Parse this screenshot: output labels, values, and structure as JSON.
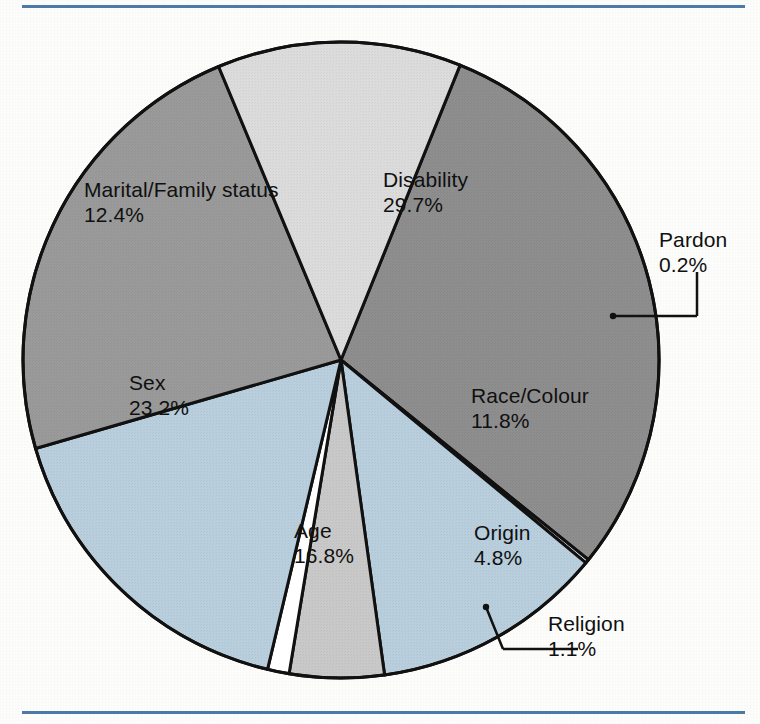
{
  "figure": {
    "frame_color": "#4b79a8",
    "background": "#fdfdfc"
  },
  "chart_data": {
    "type": "pie",
    "title": "",
    "subtitle": "",
    "xlabel": "",
    "ylabel": "",
    "units": "percent",
    "legend_position": "none",
    "labels_inline": true,
    "total": 100.0,
    "start_angle_deg": -68,
    "direction": "clockwise",
    "categories": [
      "Disability",
      "Pardon",
      "Race/Colour",
      "Origin",
      "Religion",
      "Age",
      "Sex",
      "Marital/Family status"
    ],
    "values": [
      29.7,
      0.2,
      11.8,
      4.8,
      1.1,
      16.8,
      23.2,
      12.4
    ],
    "slices": [
      {
        "name": "Disability",
        "label": "Disability",
        "value": 29.7,
        "value_text": "29.7%",
        "color": "#8e8e8e",
        "label_placement": "inside",
        "label_x": 383,
        "label_y": 168
      },
      {
        "name": "Pardon",
        "label": "Pardon",
        "value": 0.2,
        "value_text": "0.2%",
        "color": "#ffffff",
        "label_placement": "callout",
        "label_x": 659,
        "label_y": 228
      },
      {
        "name": "Race/Colour",
        "label": "Race/Colour",
        "value": 11.8,
        "value_text": "11.8%",
        "color": "#b9cfdd",
        "label_placement": "inside",
        "label_x": 471,
        "label_y": 384
      },
      {
        "name": "Origin",
        "label": "Origin",
        "value": 4.8,
        "value_text": "4.8%",
        "color": "#c9c9c9",
        "label_placement": "inside",
        "label_x": 474,
        "label_y": 521
      },
      {
        "name": "Religion",
        "label": "Religion",
        "value": 1.1,
        "value_text": "1.1%",
        "color": "#ffffff",
        "label_placement": "callout",
        "label_x": 548,
        "label_y": 612
      },
      {
        "name": "Age",
        "label": "Age",
        "value": 16.8,
        "value_text": "16.8%",
        "color": "#b9cfdd",
        "label_placement": "inside",
        "label_x": 294,
        "label_y": 519
      },
      {
        "name": "Sex",
        "label": "Sex",
        "value": 23.2,
        "value_text": "23.2%",
        "color": "#9a9a9a",
        "label_placement": "inside",
        "label_x": 129,
        "label_y": 371
      },
      {
        "name": "Marital/Family status",
        "label": "Marital/Family status",
        "value": 12.4,
        "value_text": "12.4%",
        "color": "#dcdcdc",
        "label_placement": "inside",
        "label_x": 84,
        "label_y": 178
      }
    ],
    "geometry": {
      "center_x": 341,
      "center_y": 360,
      "radius": 318,
      "outline_color": "#111111",
      "outline_width": 3
    }
  }
}
